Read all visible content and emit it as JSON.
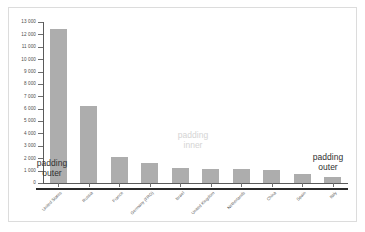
{
  "chart_data": {
    "type": "bar",
    "title": "",
    "subtitle": "",
    "xlabel": "",
    "ylabel": "",
    "ylim": [
      0,
      13000
    ],
    "ytick_step": 1000,
    "grid": false,
    "legend": null,
    "bar_color": "#adadad",
    "axis_color": "#5a5a5a",
    "baseline_color": "#2b2b2b",
    "categories": [
      "United States",
      "Russia",
      "France",
      "Germany (FRG)",
      "Israel",
      "United Kingdom",
      "Netherlands",
      "China",
      "Spain",
      "Italy"
    ],
    "values": [
      12400,
      6200,
      2100,
      1600,
      1200,
      1150,
      1100,
      1050,
      700,
      500
    ],
    "ytick_labels": [
      "0",
      "1 000",
      "2 000",
      "3 000",
      "4 000",
      "5 000",
      "6 000",
      "7 000",
      "8 000",
      "9 000",
      "10 000",
      "11 000",
      "12 000",
      "13 000"
    ],
    "ytick_values": [
      0,
      1000,
      2000,
      3000,
      4000,
      5000,
      6000,
      7000,
      8000,
      9000,
      10000,
      11000,
      12000,
      13000
    ],
    "annotations": [
      {
        "name": "padding-outer-left",
        "line1": "padding",
        "line2": "outer",
        "color": "#2f2f2f"
      },
      {
        "name": "padding-inner",
        "line1": "padding",
        "line2": "inner",
        "color": "#d4d4d4"
      },
      {
        "name": "padding-outer-right",
        "line1": "padding",
        "line2": "outer",
        "color": "#2f2f2f"
      }
    ]
  }
}
